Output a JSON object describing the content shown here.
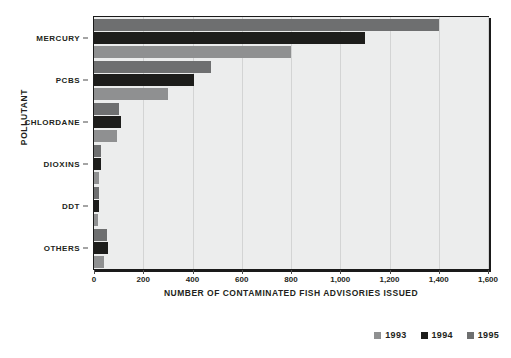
{
  "chart_data": {
    "type": "bar",
    "orientation": "horizontal",
    "title": "",
    "xlabel": "Number of Contaminated Fish Advisories issued",
    "ylabel": "Pollutant",
    "categories": [
      "Mercury",
      "PCBs",
      "Chlordane",
      "Dioxins",
      "DDT",
      "Others"
    ],
    "series": [
      {
        "name": "1993",
        "color": "#8f9091",
        "values": [
          800,
          300,
          95,
          22,
          18,
          40
        ]
      },
      {
        "name": "1994",
        "color": "#1d1d1b",
        "values": [
          1100,
          405,
          110,
          28,
          22,
          58
        ]
      },
      {
        "name": "1995",
        "color": "#6e6f70",
        "values": [
          1400,
          475,
          100,
          28,
          20,
          52
        ]
      }
    ],
    "series_draw_order_top_to_bottom": [
      "1995",
      "1994",
      "1993"
    ],
    "xlim": [
      0,
      1600
    ],
    "xticks": [
      0,
      200,
      400,
      600,
      800,
      1000,
      1200,
      1400,
      1600
    ],
    "xticklabels": [
      "0",
      "200",
      "400",
      "600",
      "800",
      "1,000",
      "1,200",
      "1,400",
      "1,600"
    ],
    "grid": "vertical",
    "legend_position": "bottom-right",
    "plot_background": "#eceded"
  },
  "legend": {
    "items": [
      {
        "label": "1993",
        "swatch_name": "legend-swatch-1993"
      },
      {
        "label": "1994",
        "swatch_name": "legend-swatch-1994"
      },
      {
        "label": "1995",
        "swatch_name": "legend-swatch-1995"
      }
    ]
  }
}
